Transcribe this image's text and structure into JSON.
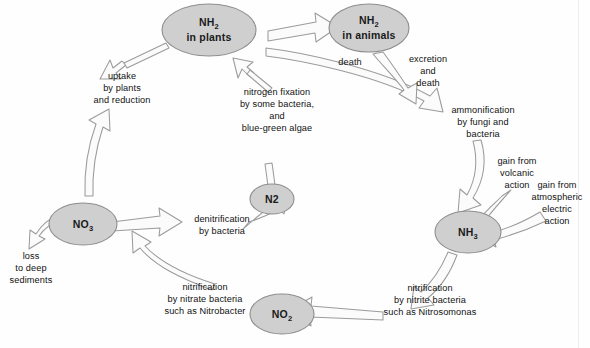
{
  "figure": {
    "background_color": "#fefefe",
    "node_fill_color": "#cfcfcf",
    "node_stroke_color": "#8d8d8d",
    "arrow_fill_color": "#fbfbfb",
    "arrow_stroke_color": "#9b9b9b",
    "text_color": "#111111"
  },
  "nodes": {
    "nh2_plants": {
      "formula": "NH",
      "subscript": "2",
      "line2": "in plants"
    },
    "nh2_animals": {
      "formula": "NH",
      "subscript": "2",
      "line2": "in animals"
    },
    "nh3": {
      "formula": "NH",
      "subscript": "3",
      "line2": ""
    },
    "no2": {
      "formula": "NO",
      "subscript": "2",
      "line2": ""
    },
    "no3": {
      "formula": "NO",
      "subscript": "3",
      "line2": ""
    },
    "n2": {
      "formula": "N2",
      "subscript": "",
      "line2": ""
    }
  },
  "captions": {
    "uptake": {
      "l1": "uptake",
      "l2": "by plants",
      "l3": "and reduction"
    },
    "nitrogen_fixation": {
      "l1": "nitrogen fixation",
      "l2": "by some bacteria,",
      "l3": "and",
      "l4": "blue-green algae"
    },
    "death": {
      "l1": "death"
    },
    "excretion": {
      "l1": "excretion",
      "l2": "and",
      "l3": "death"
    },
    "ammonification": {
      "l1": "ammonification",
      "l2": "by fungi and",
      "l3": "bacteria"
    },
    "gain_volcanic": {
      "l1": "gain from",
      "l2": "volcanic",
      "l3": "action"
    },
    "gain_atmospheric": {
      "l1": "gain from",
      "l2": "atmospheric",
      "l3": "electric",
      "l4": "action"
    },
    "nitrification_nitrite": {
      "l1": "nitrification",
      "l2": "by nitrite bacteria",
      "l3a": "such as ",
      "l3b": "Nitrosomonas"
    },
    "nitrification_nitrate": {
      "l1": "nitrification",
      "l2": "by nitrate bacteria",
      "l3a": "such as ",
      "l3b": "Nitrobacter"
    },
    "denitrification": {
      "l1": "denitrification",
      "l2": "by bacteria"
    },
    "loss": {
      "l1": "loss",
      "l2": "to deep",
      "l3": "sediments"
    }
  }
}
